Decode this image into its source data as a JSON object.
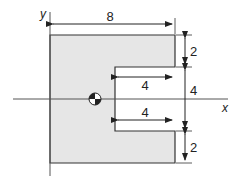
{
  "diagram": {
    "axes": {
      "x_label": "x",
      "y_label": "y"
    },
    "shape": {
      "description": "C-shaped cross-section with centroid marker",
      "fill": "#e6e6e6",
      "stroke": "#333333"
    },
    "dimensions": {
      "overall_width": "8",
      "top_flange_height": "2",
      "slot_height": "4",
      "bottom_flange_height": "2",
      "slot_depth_upper": "4",
      "slot_depth_lower": "4"
    },
    "centroid_marker": "centroid-symbol"
  }
}
